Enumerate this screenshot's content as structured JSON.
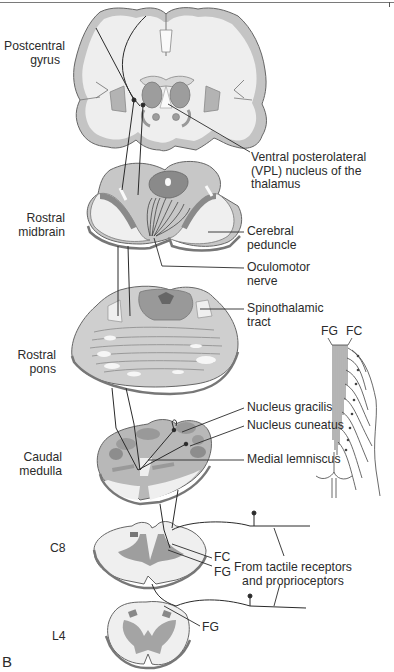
{
  "figure": {
    "panel_letter": "B",
    "levels": [
      {
        "id": "postcentral-gyrus",
        "label_line1": "Postcentral",
        "label_line2": "gyrus"
      },
      {
        "id": "rostral-midbrain",
        "label_line1": "Rostral",
        "label_line2": "midbrain"
      },
      {
        "id": "rostral-pons",
        "label_line1": "Rostral",
        "label_line2": "pons"
      },
      {
        "id": "caudal-medulla",
        "label_line1": "Caudal",
        "label_line2": "medulla"
      },
      {
        "id": "c8",
        "label_line1": "C8"
      },
      {
        "id": "l4",
        "label_line1": "L4"
      }
    ],
    "callouts": {
      "vpl_line1": "Ventral posterolateral",
      "vpl_line2": "(VPL) nucleus of the",
      "vpl_line3": "thalamus",
      "cerebral_peduncle_line1": "Cerebral",
      "cerebral_peduncle_line2": "peduncle",
      "oculomotor_line1": "Oculomotor",
      "oculomotor_line2": "nerve",
      "spinothalamic_line1": "Spinothalamic",
      "spinothalamic_line2": "tract",
      "nucleus_gracilis": "Nucleus gracilis",
      "nucleus_cuneatus": "Nucleus cuneatus",
      "medial_lemniscus": "Medial lemniscus",
      "c8_fc": "FC",
      "c8_fg": "FG",
      "l4_fg": "FG",
      "receptors_line1": "From tactile receptors",
      "receptors_line2": "and proprioceptors"
    },
    "inset": {
      "fg_label": "FG",
      "fc_label": "FC"
    },
    "colors": {
      "white_matter": "#f1f1f1",
      "gray_light": "#c9c9c9",
      "gray_mid": "#a9a9a9",
      "gray_dark": "#7e7e7e",
      "outline": "#555555",
      "pathway": "#2a2a2a"
    }
  }
}
